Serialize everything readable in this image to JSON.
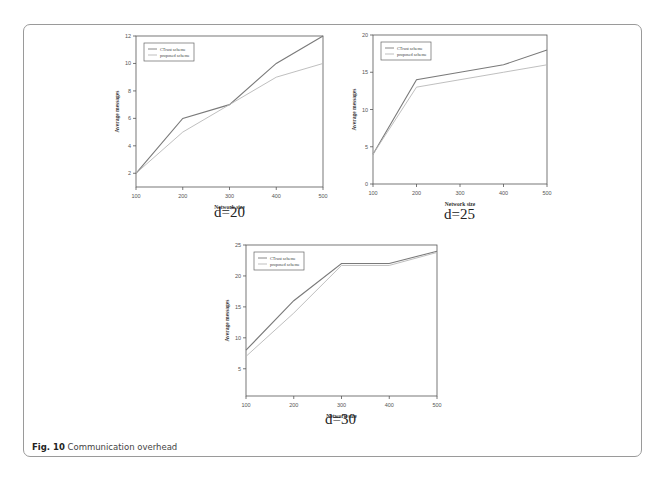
{
  "figure": {
    "caption_label": "Fig. 10",
    "caption_text": " Communication overhead",
    "colors": {
      "ctrust": "#7a7a7a",
      "proposed": "#b8b8b8",
      "axis": "#555555",
      "frame": "#9a9a9a"
    }
  },
  "chart_data": [
    {
      "type": "line",
      "subtitle": "d=20",
      "xlabel": "Network size",
      "ylabel": "Average messages",
      "x": [
        100,
        200,
        300,
        400,
        500
      ],
      "xticks": [
        100,
        200,
        300,
        400,
        500
      ],
      "yticks": [
        2,
        4,
        6,
        8,
        10,
        12
      ],
      "ylim": [
        1,
        12
      ],
      "xlim": [
        100,
        500
      ],
      "grid": false,
      "legend_position": "upper left",
      "series": [
        {
          "name": "CTrust scheme",
          "values": [
            2,
            6,
            7,
            10,
            12
          ]
        },
        {
          "name": "proposed scheme",
          "values": [
            2,
            5,
            7,
            9,
            10
          ]
        }
      ],
      "layout": {
        "x0": 136,
        "x1": 323,
        "ytop": 36,
        "ybot": 187
      }
    },
    {
      "type": "line",
      "subtitle": "d=25",
      "xlabel": "Network size",
      "ylabel": "Average messages",
      "x": [
        100,
        200,
        300,
        400,
        500
      ],
      "xticks": [
        100,
        200,
        300,
        400,
        500
      ],
      "yticks": [
        0,
        5,
        10,
        15,
        20
      ],
      "ylim": [
        0,
        20
      ],
      "xlim": [
        100,
        500
      ],
      "grid": false,
      "legend_position": "upper left",
      "series": [
        {
          "name": "CTrust scheme",
          "values": [
            4,
            14,
            15,
            16,
            18
          ]
        },
        {
          "name": "proposed scheme",
          "values": [
            4,
            13,
            14,
            15,
            16
          ]
        }
      ],
      "layout": {
        "x0": 373,
        "x1": 547,
        "ytop": 35,
        "ybot": 184
      }
    },
    {
      "type": "line",
      "subtitle": "d=30",
      "xlabel": "Network size",
      "ylabel": "Average messages",
      "x": [
        100,
        200,
        300,
        400,
        500
      ],
      "xticks": [
        100,
        200,
        300,
        400,
        500
      ],
      "yticks": [
        5,
        10,
        15,
        20,
        25
      ],
      "ylim": [
        0.6,
        25
      ],
      "xlim": [
        100,
        500
      ],
      "grid": false,
      "legend_position": "upper left",
      "series": [
        {
          "name": "CTrust scheme",
          "values": [
            8,
            16,
            22,
            22,
            24
          ]
        },
        {
          "name": "proposed scheme",
          "values": [
            7,
            14,
            21.7,
            21.7,
            23.8
          ]
        }
      ],
      "layout": {
        "x0": 246,
        "x1": 437,
        "ytop": 245,
        "ybot": 396
      }
    }
  ]
}
